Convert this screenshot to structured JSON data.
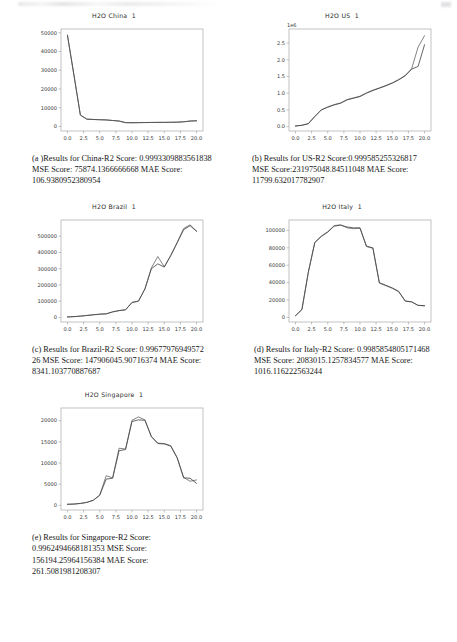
{
  "figure": {
    "panels": [
      {
        "key": "china",
        "title": "H2O China  1",
        "caption": "(a )Results for China-R2 Score: 0.99933098835618​38 MSE Score: 75874.1366666668 MAE Score: 106.9380952380954"
      },
      {
        "key": "us",
        "title": "H2O US  1",
        "caption": "(b) Results for US-R2 Score:0.999585255326817 MSE Score:231975048.84511048 MAE Score: 11799.632017782907"
      },
      {
        "key": "brazil",
        "title": "H2O Brazil  1",
        "caption": "(c) Results for Brazil-R2 Score: 0.99677976949572​26 MSE Score: 147906045.90716374 MAE Score: 8341.103770887687"
      },
      {
        "key": "italy",
        "title": "H2O Italy  1",
        "caption": "(d) Results for Italy-R2 Score: 0.9985854805171468 MSE Score: 2083015.1257834577 MAE Score: 1016.116222563244"
      },
      {
        "key": "singapore",
        "title": "H2O Singapore  1",
        "caption": "(e) Results for Singapore-R2 Score: 0.9962494668181353 MSE Score: 156194.25964156384 MAE Score: 261.5081981208307"
      }
    ]
  },
  "chart_data": [
    {
      "type": "line",
      "id": "china",
      "title": "H2O China  1",
      "xlabel": "",
      "ylabel": "",
      "xlim": [
        -1.0,
        21.0
      ],
      "ylim": [
        -2400,
        52000
      ],
      "xticks": [
        "0.0",
        "2.5",
        "5.0",
        "7.5",
        "10.0",
        "12.5",
        "15.0",
        "17.5",
        "20.0"
      ],
      "xtick_values": [
        0.0,
        2.5,
        5.0,
        7.5,
        10.0,
        12.5,
        15.0,
        17.5,
        20.0
      ],
      "yticks": [
        "0",
        "10000",
        "20000",
        "30000",
        "40000",
        "50000"
      ],
      "ytick_values": [
        0,
        10000,
        20000,
        30000,
        40000,
        50000
      ],
      "grid": false,
      "legend": false,
      "x": [
        0,
        1,
        2,
        3,
        4,
        5,
        6,
        7,
        8,
        9,
        10,
        11,
        12,
        13,
        14,
        15,
        16,
        17,
        18,
        19,
        20
      ],
      "series": [
        {
          "name": "Actual",
          "values": [
            48700,
            27500,
            6100,
            3900,
            3750,
            3600,
            3500,
            3200,
            2900,
            2050,
            2000,
            2050,
            2100,
            2150,
            2200,
            2200,
            2250,
            2300,
            2500,
            2900,
            3050
          ]
        },
        {
          "name": "Predicted",
          "values": [
            48700,
            27500,
            6150,
            3950,
            3760,
            3610,
            3510,
            3210,
            2910,
            2060,
            2010,
            2060,
            2110,
            2160,
            2210,
            2210,
            2260,
            2310,
            2510,
            2900,
            3050
          ]
        }
      ]
    },
    {
      "type": "line",
      "id": "us",
      "title": "H2O US  1",
      "xlabel": "",
      "ylabel": "",
      "y_offset_label": "1e6",
      "xlim": [
        -1.0,
        21.0
      ],
      "ylim": [
        -0.13,
        2.92
      ],
      "xticks": [
        "0.0",
        "2.5",
        "5.0",
        "7.5",
        "10.0",
        "12.5",
        "15.0",
        "17.5",
        "20.0"
      ],
      "xtick_values": [
        0.0,
        2.5,
        5.0,
        7.5,
        10.0,
        12.5,
        15.0,
        17.5,
        20.0
      ],
      "yticks": [
        "0.0",
        "0.5",
        "1.0",
        "1.5",
        "2.0",
        "2.5"
      ],
      "ytick_values": [
        0.0,
        0.5,
        1.0,
        1.5,
        2.0,
        2.5
      ],
      "grid": false,
      "legend": false,
      "x": [
        0,
        1,
        2,
        3,
        4,
        5,
        6,
        7,
        8,
        9,
        10,
        11,
        12,
        13,
        14,
        15,
        16,
        17,
        18,
        19,
        20
      ],
      "series": [
        {
          "name": "Actual",
          "values": [
            0.02,
            0.04,
            0.09,
            0.3,
            0.5,
            0.58,
            0.65,
            0.7,
            0.8,
            0.85,
            0.9,
            1.0,
            1.08,
            1.15,
            1.22,
            1.3,
            1.4,
            1.52,
            1.72,
            1.8,
            2.45
          ]
        },
        {
          "name": "Predicted",
          "values": [
            0.02,
            0.04,
            0.09,
            0.31,
            0.5,
            0.59,
            0.66,
            0.71,
            0.81,
            0.86,
            0.91,
            1.01,
            1.09,
            1.16,
            1.23,
            1.31,
            1.41,
            1.53,
            1.73,
            2.38,
            2.72
          ]
        }
      ]
    },
    {
      "type": "line",
      "id": "brazil",
      "title": "H2O Brazil  1",
      "xlabel": "",
      "ylabel": "",
      "xlim": [
        -1.0,
        21.0
      ],
      "ylim": [
        -28000,
        600000
      ],
      "xticks": [
        "0.0",
        "2.5",
        "5.0",
        "7.5",
        "10.0",
        "12.5",
        "15.0",
        "17.5",
        "20.0"
      ],
      "xtick_values": [
        0.0,
        2.5,
        5.0,
        7.5,
        10.0,
        12.5,
        15.0,
        17.5,
        20.0
      ],
      "yticks": [
        "0",
        "100000",
        "200000",
        "300000",
        "400000",
        "500000"
      ],
      "ytick_values": [
        0,
        100000,
        200000,
        300000,
        400000,
        500000
      ],
      "grid": false,
      "legend": false,
      "x": [
        0,
        1,
        2,
        3,
        4,
        5,
        6,
        7,
        8,
        9,
        10,
        11,
        12,
        13,
        14,
        15,
        16,
        17,
        18,
        19,
        20
      ],
      "series": [
        {
          "name": "Actual",
          "values": [
            3000,
            5000,
            8000,
            12000,
            16000,
            20000,
            22000,
            34000,
            42000,
            47000,
            92000,
            100000,
            175000,
            300000,
            330000,
            310000,
            380000,
            460000,
            540000,
            565000,
            530000
          ]
        },
        {
          "name": "Predicted",
          "values": [
            3000,
            5200,
            8200,
            12500,
            16500,
            20500,
            22500,
            34500,
            42500,
            47500,
            93000,
            101000,
            176000,
            305000,
            375000,
            312000,
            382000,
            462000,
            548000,
            570000,
            532000
          ]
        }
      ]
    },
    {
      "type": "line",
      "id": "italy",
      "title": "H2O Italy  1",
      "xlabel": "",
      "ylabel": "",
      "xlim": [
        -1.0,
        21.0
      ],
      "ylim": [
        -5200,
        112000
      ],
      "xticks": [
        "0.0",
        "2.5",
        "5.0",
        "7.5",
        "10.0",
        "12.5",
        "15.0",
        "17.5",
        "20.0"
      ],
      "xtick_values": [
        0.0,
        2.5,
        5.0,
        7.5,
        10.0,
        12.5,
        15.0,
        17.5,
        20.0
      ],
      "yticks": [
        "0",
        "20000",
        "40000",
        "60000",
        "80000",
        "100000"
      ],
      "ytick_values": [
        0,
        20000,
        40000,
        60000,
        80000,
        100000
      ],
      "grid": false,
      "legend": false,
      "x": [
        0,
        1,
        2,
        3,
        4,
        5,
        6,
        7,
        8,
        9,
        10,
        11,
        12,
        13,
        14,
        15,
        16,
        17,
        18,
        19,
        20
      ],
      "series": [
        {
          "name": "Actual",
          "values": [
            2000,
            9000,
            52000,
            86000,
            93000,
            98000,
            105000,
            106000,
            104000,
            103000,
            103000,
            82000,
            80000,
            40000,
            37000,
            34000,
            30000,
            19000,
            18000,
            14000,
            13500
          ]
        },
        {
          "name": "Predicted",
          "values": [
            2000,
            9200,
            52500,
            86500,
            93500,
            98500,
            105500,
            106500,
            103000,
            102000,
            102500,
            81500,
            79500,
            39500,
            36500,
            33500,
            29500,
            18800,
            17800,
            13800,
            13400
          ]
        }
      ]
    },
    {
      "type": "line",
      "id": "singapore",
      "title": "H2O Singapore  1",
      "xlabel": "",
      "ylabel": "",
      "xlim": [
        -1.0,
        21.0
      ],
      "ylim": [
        -1100,
        23000
      ],
      "xticks": [
        "0.0",
        "2.5",
        "5.0",
        "7.5",
        "10.0",
        "12.5",
        "15.0",
        "17.5",
        "20.0"
      ],
      "xtick_values": [
        0.0,
        2.5,
        5.0,
        7.5,
        10.0,
        12.5,
        15.0,
        17.5,
        20.0
      ],
      "yticks": [
        "0",
        "5000",
        "10000",
        "15000",
        "20000"
      ],
      "ytick_values": [
        0,
        5000,
        10000,
        15000,
        20000
      ],
      "grid": false,
      "legend": false,
      "x": [
        0,
        1,
        2,
        3,
        4,
        5,
        6,
        7,
        8,
        9,
        10,
        11,
        12,
        13,
        14,
        15,
        16,
        17,
        18,
        19,
        20
      ],
      "series": [
        {
          "name": "Actual",
          "values": [
            250,
            300,
            450,
            700,
            1200,
            2400,
            6200,
            6400,
            12900,
            13200,
            19800,
            20200,
            20100,
            16200,
            14600,
            14500,
            14000,
            11200,
            6500,
            6400,
            5200
          ]
        },
        {
          "name": "Predicted",
          "values": [
            250,
            300,
            450,
            700,
            1200,
            2400,
            7000,
            6500,
            13500,
            13300,
            20100,
            20900,
            20200,
            16300,
            14700,
            14600,
            14100,
            11300,
            6600,
            5700,
            6000
          ]
        }
      ]
    }
  ]
}
